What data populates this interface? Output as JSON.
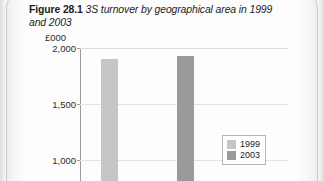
{
  "caption": {
    "figure_label": "Figure 28.1",
    "title": "3S turnover by geographical area in 1999 and 2003"
  },
  "colors": {
    "series_1999": "#c6c6c6",
    "series_2003": "#9a9a9a",
    "axis": "#9a9a9a",
    "gridline": "#e3e3e3",
    "legend_border": "#b4b4b4",
    "page_background": "#fdfdfd",
    "text": "#1b1b1b"
  },
  "legend": {
    "position": "inside-right",
    "items": [
      {
        "label": "1999",
        "color": "#c6c6c6"
      },
      {
        "label": "2003",
        "color": "#9a9a9a"
      }
    ]
  },
  "chart_data": {
    "type": "bar",
    "title": "3S turnover by geographical area in 1999 and 2003",
    "xlabel": "",
    "ylabel": "£000",
    "ylim": [
      1000,
      2000
    ],
    "yticks": [
      2000,
      1500,
      1000
    ],
    "ytick_labels": [
      "2,000",
      "1,500",
      "1,000"
    ],
    "grid": true,
    "note": "Chart is cropped; plot continues below the 1,000 gridline and category axis labels are not visible.",
    "categories": [
      "Category 1"
    ],
    "series": [
      {
        "name": "1999",
        "color": "#c6c6c6",
        "values": [
          1900
        ]
      },
      {
        "name": "2003",
        "color": "#9a9a9a",
        "values": [
          1930
        ]
      }
    ]
  }
}
